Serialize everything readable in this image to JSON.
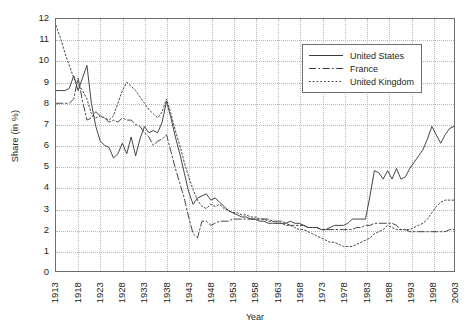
{
  "chart_data": {
    "type": "line",
    "title": "",
    "xlabel": "Year",
    "ylabel": "Share (in %)",
    "xlim": [
      1913,
      2003
    ],
    "ylim": [
      0,
      12
    ],
    "yticks": [
      0,
      1,
      2,
      3,
      4,
      5,
      6,
      7,
      8,
      9,
      10,
      11,
      12
    ],
    "xticks": [
      "1913",
      "1918",
      "1923",
      "1928",
      "1933",
      "1938",
      "1943",
      "1948",
      "1953",
      "1958",
      "1963",
      "1968",
      "1973",
      "1978",
      "1983",
      "1988",
      "1993",
      "1998",
      "2003"
    ],
    "grid": true,
    "legend_position": "top-right",
    "x": [
      1913,
      1914,
      1915,
      1916,
      1917,
      1918,
      1919,
      1920,
      1921,
      1922,
      1923,
      1924,
      1925,
      1926,
      1927,
      1928,
      1929,
      1930,
      1931,
      1932,
      1933,
      1934,
      1935,
      1936,
      1937,
      1938,
      1939,
      1940,
      1941,
      1942,
      1943,
      1944,
      1945,
      1946,
      1947,
      1948,
      1949,
      1950,
      1951,
      1952,
      1953,
      1954,
      1955,
      1956,
      1957,
      1958,
      1959,
      1960,
      1961,
      1962,
      1963,
      1964,
      1965,
      1966,
      1967,
      1968,
      1969,
      1970,
      1971,
      1972,
      1973,
      1974,
      1975,
      1976,
      1977,
      1978,
      1979,
      1980,
      1981,
      1982,
      1983,
      1984,
      1985,
      1986,
      1987,
      1988,
      1989,
      1990,
      1991,
      1992,
      1993,
      1994,
      1995,
      1996,
      1997,
      1998,
      1999,
      2000,
      2001,
      2002,
      2003
    ],
    "series": [
      {
        "name": "United States",
        "style": "solid",
        "color": "#3a3a3a",
        "values": [
          8.6,
          8.6,
          8.6,
          8.7,
          9.3,
          8.6,
          9.2,
          9.8,
          8.0,
          6.9,
          6.2,
          6.0,
          5.9,
          5.4,
          5.6,
          6.1,
          5.6,
          6.4,
          5.5,
          6.3,
          6.9,
          6.6,
          6.7,
          6.6,
          7.1,
          8.1,
          7.3,
          6.4,
          5.6,
          4.7,
          3.8,
          3.2,
          3.5,
          3.6,
          3.7,
          3.4,
          3.5,
          3.3,
          3.1,
          2.9,
          2.8,
          2.7,
          2.6,
          2.6,
          2.5,
          2.5,
          2.4,
          2.4,
          2.3,
          2.3,
          2.3,
          2.3,
          2.3,
          2.4,
          2.3,
          2.3,
          2.2,
          2.1,
          2.1,
          2.1,
          2.0,
          2.0,
          2.1,
          2.2,
          2.2,
          2.2,
          2.3,
          2.5,
          2.5,
          2.5,
          2.5,
          3.6,
          4.8,
          4.7,
          4.4,
          4.8,
          4.4,
          4.9,
          4.4,
          4.5,
          4.9,
          5.2,
          5.5,
          5.8,
          6.3,
          6.9,
          6.5,
          6.1,
          6.5,
          6.8,
          6.9
        ]
      },
      {
        "name": "France",
        "style": "dashdot",
        "color": "#3a3a3a",
        "values": [
          8.0,
          8.0,
          8.0,
          8.0,
          8.2,
          9.2,
          8.1,
          7.2,
          7.3,
          7.6,
          7.4,
          7.3,
          7.1,
          7.2,
          7.1,
          7.3,
          7.2,
          7.2,
          7.0,
          6.9,
          6.6,
          6.4,
          6.0,
          6.2,
          6.3,
          6.5,
          5.7,
          4.9,
          4.2,
          3.5,
          2.6,
          1.8,
          1.6,
          2.4,
          2.4,
          2.2,
          2.3,
          2.4,
          2.4,
          2.4,
          2.5,
          2.5,
          2.5,
          2.5,
          2.5,
          2.5,
          2.5,
          2.5,
          2.5,
          2.4,
          2.4,
          2.4,
          2.3,
          2.2,
          2.2,
          2.2,
          2.2,
          2.1,
          2.1,
          2.1,
          2.0,
          2.0,
          2.0,
          2.0,
          2.0,
          2.0,
          2.0,
          2.0,
          2.1,
          2.1,
          2.2,
          2.2,
          2.3,
          2.3,
          2.3,
          2.3,
          2.3,
          2.2,
          2.0,
          2.0,
          1.9,
          1.9,
          1.9,
          1.9,
          1.9,
          1.9,
          1.9,
          1.9,
          1.9,
          2.0,
          2.0
        ]
      },
      {
        "name": "United Kingdom",
        "style": "dotted",
        "color": "#3a3a3a",
        "values": [
          11.7,
          11.1,
          10.4,
          9.8,
          9.2,
          8.9,
          8.6,
          8.2,
          7.5,
          7.3,
          7.4,
          7.3,
          7.2,
          7.4,
          8.0,
          8.6,
          9.0,
          8.8,
          8.6,
          8.3,
          8.0,
          7.7,
          7.5,
          7.3,
          7.6,
          8.2,
          7.5,
          6.7,
          6.0,
          5.2,
          4.5,
          3.9,
          3.4,
          3.1,
          3.0,
          3.2,
          3.1,
          3.2,
          3.0,
          2.9,
          2.8,
          2.8,
          2.7,
          2.7,
          2.6,
          2.6,
          2.5,
          2.5,
          2.4,
          2.4,
          2.3,
          2.3,
          2.2,
          2.2,
          2.1,
          2.0,
          2.0,
          1.9,
          1.8,
          1.7,
          1.6,
          1.5,
          1.4,
          1.4,
          1.3,
          1.2,
          1.2,
          1.2,
          1.3,
          1.4,
          1.5,
          1.6,
          1.8,
          1.9,
          2.0,
          2.2,
          2.1,
          2.0,
          2.0,
          2.0,
          2.0,
          2.1,
          2.2,
          2.3,
          2.5,
          2.8,
          3.1,
          3.3,
          3.4,
          3.4,
          3.4
        ]
      }
    ]
  },
  "legend": {
    "entries": [
      {
        "label": "United States"
      },
      {
        "label": "France"
      },
      {
        "label": "United Kingdom"
      }
    ]
  }
}
